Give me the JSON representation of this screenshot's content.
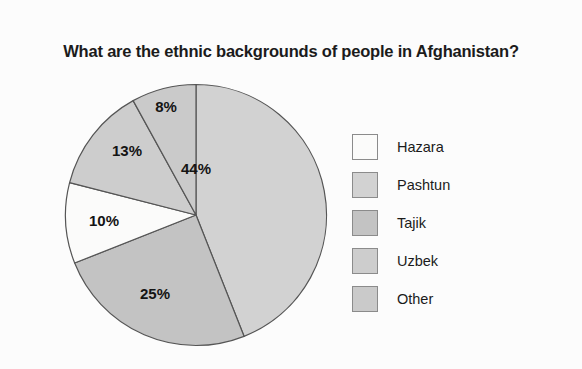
{
  "chart_data": {
    "type": "pie",
    "title": "What are the ethnic backgrounds of people in Afghanistan?",
    "categories": [
      "Hazara",
      "Pashtun",
      "Tajik",
      "Uzbek",
      "Other"
    ],
    "values": [
      10,
      44,
      25,
      13,
      8
    ],
    "value_labels": [
      "10%",
      "44%",
      "25%",
      "13%",
      "8%"
    ],
    "unit": "%",
    "legend_position": "right",
    "grid": false,
    "start_angle_deg": 0,
    "direction": "clockwise",
    "draw_order": [
      "Pashtun",
      "Tajik",
      "Hazara",
      "Uzbek",
      "Other"
    ],
    "colors": {
      "Hazara": "#fbfbfa",
      "Pashtun": "#d2d2d2",
      "Tajik": "#c3c3c3",
      "Uzbek": "#cdcdcd",
      "Other": "#cacaca",
      "outline": "#555555",
      "background": "#fcfcfc",
      "text": "#1b1b1b"
    },
    "slices": [
      {
        "name": "Pashtun",
        "value": 44,
        "label": "44%",
        "color": "#d2d2d2",
        "start_deg": 0,
        "end_deg": 158.4,
        "label_x": 196,
        "label_y": 170
      },
      {
        "name": "Tajik",
        "value": 25,
        "label": "25%",
        "color": "#c3c3c3",
        "start_deg": 158.4,
        "end_deg": 248.4,
        "label_x": 155,
        "label_y": 295
      },
      {
        "name": "Hazara",
        "value": 10,
        "label": "10%",
        "color": "#fbfbfa",
        "start_deg": 248.4,
        "end_deg": 284.4,
        "label_x": 104,
        "label_y": 222
      },
      {
        "name": "Uzbek",
        "value": 13,
        "label": "13%",
        "color": "#cdcdcd",
        "start_deg": 284.4,
        "end_deg": 331.2,
        "label_x": 127,
        "label_y": 152
      },
      {
        "name": "Other",
        "value": 8,
        "label": "8%",
        "color": "#cacaca",
        "start_deg": 331.2,
        "end_deg": 360,
        "label_x": 166,
        "label_y": 108
      }
    ]
  },
  "legend": {
    "items": [
      {
        "label": "Hazara",
        "color": "#fbfbfa"
      },
      {
        "label": "Pashtun",
        "color": "#d2d2d2"
      },
      {
        "label": "Tajik",
        "color": "#c3c3c3"
      },
      {
        "label": "Uzbek",
        "color": "#cdcdcd"
      },
      {
        "label": "Other",
        "color": "#cacaca"
      }
    ]
  }
}
